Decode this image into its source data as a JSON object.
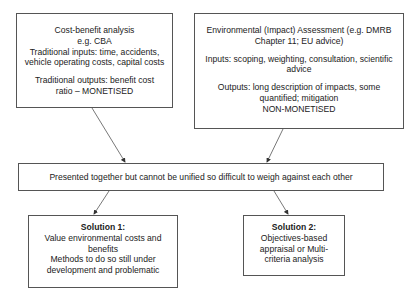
{
  "diagram": {
    "boxes": {
      "cba": {
        "lines": [
          "Cost-benefit analysis",
          "e.g. CBA",
          "Traditional inputs: time, accidents,",
          "vehicle operating costs, capital costs"
        ],
        "outputs": [
          "Traditional outputs: benefit cost",
          "ratio – MONETISED"
        ]
      },
      "eia": {
        "title": [
          "Environmental (Impact) Assessment (e.g. DMRB",
          "Chapter 11; EU advice)"
        ],
        "inputs": [
          "Inputs: scoping, weighting, consultation, scientific",
          "advice"
        ],
        "outputs": [
          "Outputs: long description of impacts, some",
          "quantified; mitigation",
          "NON-MONETISED"
        ]
      },
      "middle": {
        "text": "Presented together but cannot be unified so difficult to weigh against each other"
      },
      "solution1": {
        "heading": "Solution 1:",
        "lines": [
          "Value environmental costs and",
          "benefits",
          "Methods to do so still under",
          "development and problematic"
        ]
      },
      "solution2": {
        "heading": "Solution 2:",
        "lines": [
          "Objectives-based",
          "appraisal or Multi-",
          "criteria analysis"
        ]
      }
    },
    "arrows": [
      {
        "from": "cba",
        "to": "middle"
      },
      {
        "from": "eia",
        "to": "middle"
      },
      {
        "from": "middle",
        "to": "solution1"
      },
      {
        "from": "middle",
        "to": "solution2"
      }
    ],
    "colors": {
      "line": "#555555",
      "text": "#222222",
      "background": "#ffffff"
    }
  }
}
